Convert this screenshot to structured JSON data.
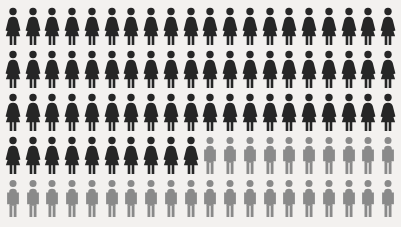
{
  "chart_data": {
    "type": "pictogram",
    "title": "",
    "subtitle": "",
    "xlabel": "",
    "ylabel": "",
    "grid": {
      "columns": 20,
      "rows": 5,
      "total_icons": 100
    },
    "unit_value": 1,
    "unit_label": "1 person",
    "categories": [
      "Women",
      "Men"
    ],
    "values": [
      70,
      30
    ],
    "percentages": [
      "70%",
      "30%"
    ],
    "series": [
      {
        "name": "Women",
        "icon": "female-figure-icon",
        "color": "#262626",
        "value": 70
      },
      {
        "name": "Men",
        "icon": "male-figure-icon",
        "color": "#8a8a8a",
        "value": 30
      }
    ],
    "legend": [],
    "annotations": [],
    "rows": [
      {
        "index": 1,
        "cells": [
          "female",
          "female",
          "female",
          "female",
          "female",
          "female",
          "female",
          "female",
          "female",
          "female",
          "female",
          "female",
          "female",
          "female",
          "female",
          "female",
          "female",
          "female",
          "female",
          "female"
        ]
      },
      {
        "index": 2,
        "cells": [
          "female",
          "female",
          "female",
          "female",
          "female",
          "female",
          "female",
          "female",
          "female",
          "female",
          "female",
          "female",
          "female",
          "female",
          "female",
          "female",
          "female",
          "female",
          "female",
          "female"
        ]
      },
      {
        "index": 3,
        "cells": [
          "female",
          "female",
          "female",
          "female",
          "female",
          "female",
          "female",
          "female",
          "female",
          "female",
          "female",
          "female",
          "female",
          "female",
          "female",
          "female",
          "female",
          "female",
          "female",
          "female"
        ]
      },
      {
        "index": 4,
        "cells": [
          "female",
          "female",
          "female",
          "female",
          "female",
          "female",
          "female",
          "female",
          "female",
          "female",
          "male",
          "male",
          "male",
          "male",
          "male",
          "male",
          "male",
          "male",
          "male",
          "male"
        ]
      },
      {
        "index": 5,
        "cells": [
          "male",
          "male",
          "male",
          "male",
          "male",
          "male",
          "male",
          "male",
          "male",
          "male",
          "male",
          "male",
          "male",
          "male",
          "male",
          "male",
          "male",
          "male",
          "male",
          "male"
        ]
      }
    ]
  },
  "colors": {
    "background": "#f3f1ef",
    "female": "#262626",
    "male": "#8a8a8a"
  }
}
